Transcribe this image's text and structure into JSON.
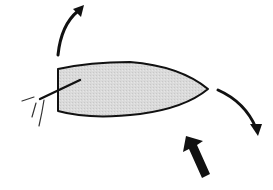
{
  "diagram": {
    "title": "",
    "colors": {
      "background": "#ffffff",
      "hull_fill": "#d9d9d9",
      "stroke": "#111111"
    },
    "elements": [
      {
        "id": "hull",
        "label": "boat-hull",
        "shape": "pointed-bow top view"
      },
      {
        "id": "tiller",
        "label": "tiller"
      },
      {
        "id": "wake",
        "label": "wake-lines"
      },
      {
        "id": "stern-rotation-arrow",
        "label": "curved arrow up (stern swing)"
      },
      {
        "id": "bow-rotation-arrow",
        "label": "curved arrow down-right (bow swing)"
      },
      {
        "id": "force-arrow",
        "label": "thick arrow pushing up-left"
      }
    ]
  }
}
